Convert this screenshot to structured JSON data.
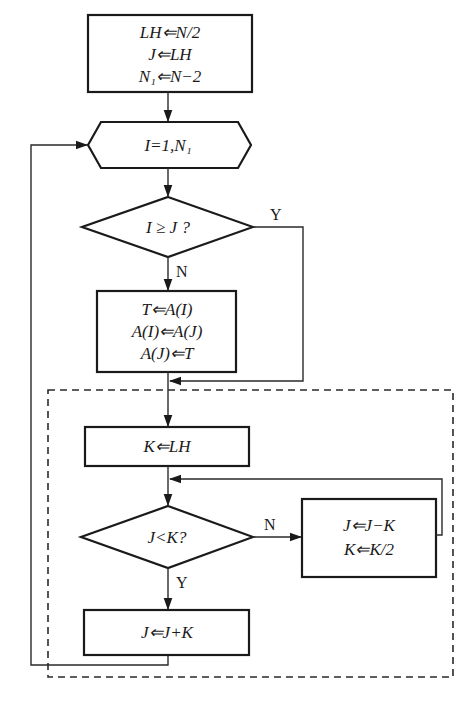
{
  "flowchart": {
    "init_box": {
      "lines": [
        "LH⇐N/2",
        "J⇐LH",
        "N₁⇐N−2"
      ]
    },
    "loop_hexagon": {
      "label": "I=1,N₁"
    },
    "decision_1": {
      "label": "I ≥ J ?",
      "yes_label": "Y",
      "no_label": "N"
    },
    "swap_box": {
      "lines": [
        "T⇐A(I)",
        "A(I)⇐A(J)",
        "A(J)⇐T"
      ]
    },
    "inner_block": {
      "k_box": {
        "label": "K⇐LH"
      },
      "decision_2": {
        "label": "J<K?",
        "yes_label": "Y",
        "no_label": "N"
      },
      "update_box": {
        "lines": [
          "J⇐J−K",
          "K⇐K/2"
        ]
      },
      "final_box": {
        "label": "J⇐J+K"
      }
    }
  }
}
